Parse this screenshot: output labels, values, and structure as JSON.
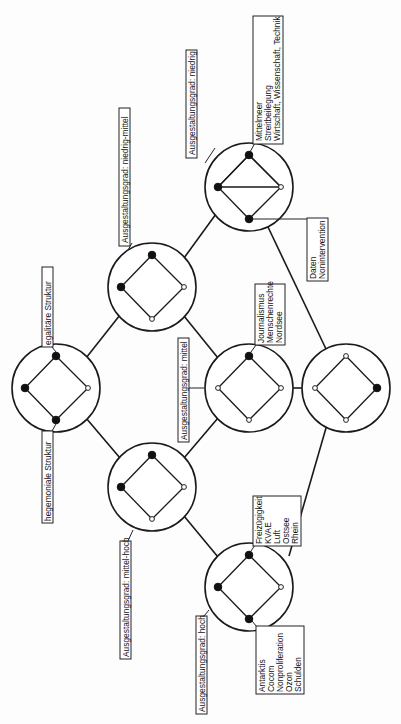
{
  "diagram": {
    "type": "lattice",
    "orientation": "rotated-90-ccw",
    "colors": {
      "line": "#1a1a1a",
      "node_filled": "#111111",
      "node_empty": "#ffffff",
      "background": "#fdfdfd"
    },
    "circles": [
      {
        "id": "A",
        "cx": 249,
        "cy": 187,
        "nodes": {
          "top": "filled",
          "left": "filled",
          "right": "empty",
          "bottom": "filled"
        }
      },
      {
        "id": "B",
        "cx": 152,
        "cy": 287,
        "nodes": {
          "top": "filled",
          "left": "filled",
          "right": "empty",
          "bottom": "empty"
        }
      },
      {
        "id": "C",
        "cx": 56,
        "cy": 388,
        "nodes": {
          "top": "filled",
          "left": "filled",
          "right": "empty",
          "bottom": "filled"
        }
      },
      {
        "id": "D",
        "cx": 249,
        "cy": 388,
        "nodes": {
          "top": "filled",
          "left": "empty",
          "right": "empty",
          "bottom": "empty"
        }
      },
      {
        "id": "E",
        "cx": 346,
        "cy": 388,
        "nodes": {
          "top": "empty",
          "left": "empty",
          "right": "filled",
          "bottom": "empty"
        }
      },
      {
        "id": "F",
        "cx": 152,
        "cy": 487,
        "nodes": {
          "top": "filled",
          "left": "filled",
          "right": "empty",
          "bottom": "empty"
        }
      },
      {
        "id": "G",
        "cx": 249,
        "cy": 587,
        "nodes": {
          "top": "filled",
          "left": "filled",
          "right": "empty",
          "bottom": "filled"
        }
      }
    ],
    "edges": [
      [
        "A",
        "B"
      ],
      [
        "A",
        "E"
      ],
      [
        "B",
        "C"
      ],
      [
        "B",
        "D"
      ],
      [
        "C",
        "F"
      ],
      [
        "D",
        "E"
      ],
      [
        "D",
        "F"
      ],
      [
        "E",
        "G"
      ],
      [
        "F",
        "G"
      ]
    ],
    "labels": {
      "niedrig": "Ausgestaltungsgrad: niedrig",
      "niedrig_mittel": "Ausgestaltungsgrad: niedrig-mittel",
      "mittel": "Ausgestaltungsgrad: mittel",
      "mittel_hoch": "Ausgestaltungsgrad: mittel-hoch",
      "hoch": "Ausgestaltungsgrad: hoch",
      "egalitaer": "egalitäre Struktur",
      "hegemonial": "hegemoniale Struktur"
    },
    "lists": {
      "a_top": [
        "Mittelmeer",
        "Streitbeilegung",
        "Wirtschaft, Wissenschaft, Technik"
      ],
      "a_bottom": [
        "Daten",
        "Nonintervention"
      ],
      "d_top": [
        "Journalismus",
        "Menschenrechte",
        "Nordsee"
      ],
      "g_top": [
        "Freizügigkeit",
        "KVAE",
        "Luft",
        "Ostsee",
        "Rhein"
      ],
      "g_bottom": [
        "Antarktis",
        "Cocom",
        "Nonproliferation",
        "Ozon",
        "Schulden"
      ]
    }
  }
}
